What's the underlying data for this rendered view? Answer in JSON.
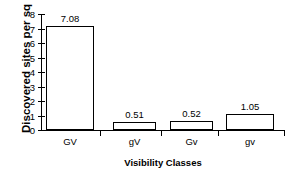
{
  "chart_data": {
    "type": "bar",
    "title": "",
    "categories": [
      "GV",
      "gV",
      "Gv",
      "gv"
    ],
    "values": [
      7.08,
      0.51,
      0.52,
      1.05
    ],
    "value_labels": [
      "7.08",
      "0.51",
      "0.52",
      "1.05"
    ],
    "xlabel": "Visibility Classes",
    "ylabel": "Discovered sites per sq km",
    "ylim": [
      0,
      8
    ],
    "yticks": [
      0,
      1,
      2,
      3,
      4,
      5,
      6,
      7,
      8
    ],
    "ytick_labels": [
      "0",
      "1",
      "2",
      "3",
      "4",
      "5",
      "6",
      "7",
      "8"
    ],
    "grid": false,
    "legend": null,
    "bar_fill_color": "#ffffff",
    "bar_edge_color": "#000000",
    "axis_color": "#000000",
    "background_color": "#ffffff"
  }
}
